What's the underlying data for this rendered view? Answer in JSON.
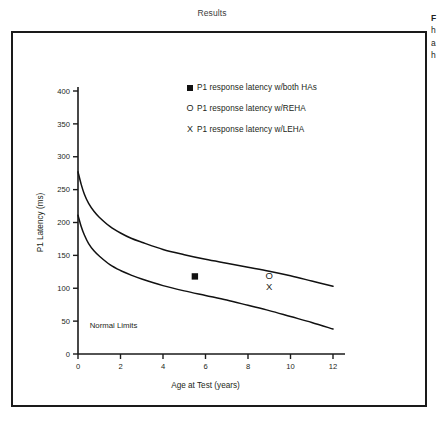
{
  "section": {
    "title": "Results"
  },
  "caption": {
    "lines": [
      "F",
      "h",
      "a",
      "h"
    ]
  },
  "legend": {
    "items": [
      {
        "marker": "filled-square",
        "glyph": "■",
        "label": "P1 response latency w/both HAs"
      },
      {
        "marker": "open-circle",
        "glyph": "O",
        "label": "P1 response latency w/REHA"
      },
      {
        "marker": "cross",
        "glyph": "X",
        "label": "P1 response latency w/LEHA"
      }
    ]
  },
  "chart_data": {
    "type": "line",
    "title": "",
    "xlabel": "Age at Test (years)",
    "ylabel": "P1 Latency (ms)",
    "xlim": [
      0,
      12
    ],
    "ylim": [
      0,
      400
    ],
    "xticks": [
      0,
      2,
      4,
      6,
      8,
      10,
      12
    ],
    "yticks": [
      0,
      50,
      100,
      150,
      200,
      250,
      300,
      350,
      400
    ],
    "grid": false,
    "legend_position": "top-center-inside",
    "annotations": [
      {
        "text": "Normal Limits",
        "x": 0.55,
        "y": 40
      }
    ],
    "series": [
      {
        "name": "Normal limits upper bound",
        "type": "line",
        "x": [
          0.0,
          0.15,
          0.3,
          0.5,
          0.75,
          1.0,
          1.5,
          2.0,
          2.5,
          3.0,
          4.0,
          5.0,
          6.0,
          7.0,
          8.0,
          9.0,
          10.0,
          11.0,
          12.0
        ],
        "y": [
          277,
          258,
          243,
          229,
          217,
          208,
          194,
          184,
          176,
          170,
          159,
          151,
          144,
          138,
          132,
          126,
          119,
          111,
          103
        ]
      },
      {
        "name": "Normal limits lower bound",
        "type": "line",
        "x": [
          0.0,
          0.15,
          0.3,
          0.5,
          0.75,
          1.0,
          1.5,
          2.0,
          2.5,
          3.0,
          4.0,
          5.0,
          6.0,
          7.0,
          8.0,
          9.0,
          10.0,
          11.0,
          12.0
        ],
        "y": [
          211,
          194,
          181,
          168,
          157,
          149,
          136,
          127,
          120,
          114,
          104,
          96,
          89,
          82,
          74,
          66,
          57,
          48,
          38
        ]
      },
      {
        "name": "P1 response latency w/both HAs",
        "type": "scatter",
        "marker": "filled-square",
        "points": [
          {
            "x": 5.5,
            "y": 118
          }
        ]
      },
      {
        "name": "P1 response latency w/REHA",
        "type": "scatter",
        "marker": "open-circle",
        "glyph": "O",
        "points": [
          {
            "x": 9.0,
            "y": 120
          }
        ]
      },
      {
        "name": "P1 response latency w/LEHA",
        "type": "scatter",
        "marker": "cross",
        "glyph": "X",
        "points": [
          {
            "x": 9.0,
            "y": 103
          }
        ]
      }
    ]
  }
}
